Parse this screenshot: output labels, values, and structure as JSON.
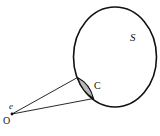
{
  "diagram": {
    "labels": {
      "surface": "S",
      "cap": "C",
      "eye": "e",
      "origin": "O"
    },
    "colors": {
      "stroke": "#111111",
      "cap_fill": "#b8b8b8",
      "background": "#ffffff"
    }
  }
}
